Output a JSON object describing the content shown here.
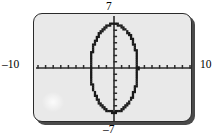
{
  "figure": {
    "kind": "graphing-calculator-screen",
    "screen_fill": "#e9e9e9",
    "screen_border": "#2b2b2b",
    "curve_color": "#1a1a1a",
    "axis_color": "#2b2b2b"
  },
  "labels": {
    "y_max": "7",
    "y_min": "–7",
    "x_min": "–10",
    "x_max": "10"
  },
  "chart_data": {
    "type": "line",
    "title": "",
    "subtitle": "",
    "xlabel": "",
    "ylabel": "",
    "grid": false,
    "legend_position": "none",
    "window": {
      "xmin": -10,
      "xmax": 10,
      "ymin": -7,
      "ymax": 7,
      "xscl": 1,
      "yscl": 1
    },
    "axis_tick_labels": {
      "x": [
        "–10",
        "10"
      ],
      "y": [
        "–7",
        "7"
      ]
    },
    "annotations": [
      "Graph window [–10, 10] by [–7, 7]",
      "Closed ellipse curve centered at the origin",
      "Vertical major axis reaching y = ±7",
      "Horizontal minor axis reaching x ≈ ±3.1",
      "Curve drawn with visible calculator pixel stair-stepping"
    ],
    "series": [
      {
        "name": "ellipse",
        "closed": true,
        "center": [
          0,
          0
        ],
        "semi_axis_x": 3.1,
        "semi_axis_y": 7,
        "x": [
          0.0,
          0.61,
          1.19,
          1.72,
          2.19,
          2.56,
          2.84,
          3.0,
          3.06,
          3.0,
          2.84,
          2.56,
          2.19,
          1.72,
          1.19,
          0.61,
          0.0,
          -0.61,
          -1.19,
          -1.72,
          -2.19,
          -2.56,
          -2.84,
          -3.0,
          -3.06,
          -3.0,
          -2.84,
          -2.56,
          -2.19,
          -1.72,
          -1.19,
          -0.61,
          0.0
        ],
        "y": [
          7.0,
          6.87,
          6.47,
          5.83,
          4.95,
          3.89,
          2.68,
          1.37,
          0.0,
          -1.37,
          -2.68,
          -3.89,
          -4.95,
          -5.83,
          -6.47,
          -6.87,
          -7.0,
          -6.87,
          -6.47,
          -5.83,
          -4.95,
          -3.89,
          -2.68,
          -1.37,
          0.0,
          1.37,
          2.68,
          3.89,
          4.95,
          5.83,
          6.47,
          6.87,
          7.0
        ]
      }
    ]
  }
}
